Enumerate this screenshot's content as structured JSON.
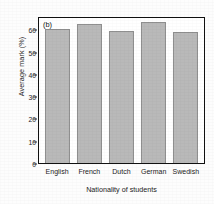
{
  "figure": {
    "panel_label": "(b)",
    "background_color": "#fdfdfd"
  },
  "chart_data": {
    "type": "bar",
    "title": "",
    "panel_label": "(b)",
    "categories": [
      "English",
      "French",
      "Dutch",
      "German",
      "Swedish"
    ],
    "values": [
      60.2,
      62.5,
      59.3,
      63.5,
      58.8
    ],
    "series": [
      {
        "name": "Average mark",
        "values": [
          60.2,
          62.5,
          59.3,
          63.5,
          58.8
        ]
      }
    ],
    "xlabel": "Nationality of students",
    "ylabel": "Average mark (%)",
    "ylim": [
      0,
      66
    ],
    "yticks": [
      0,
      10,
      20,
      30,
      40,
      50,
      60
    ],
    "ytick_labels": [
      "0",
      "10",
      "20",
      "30",
      "40",
      "50",
      "60"
    ],
    "grid": false,
    "legend": null,
    "bar_fill_color": "#b9b9b9",
    "bar_edge_color": "#8f8f8f",
    "axis_color": "#111111"
  },
  "axes": {
    "y_title": "Average mark (%)",
    "x_title": "Nationality of students"
  }
}
